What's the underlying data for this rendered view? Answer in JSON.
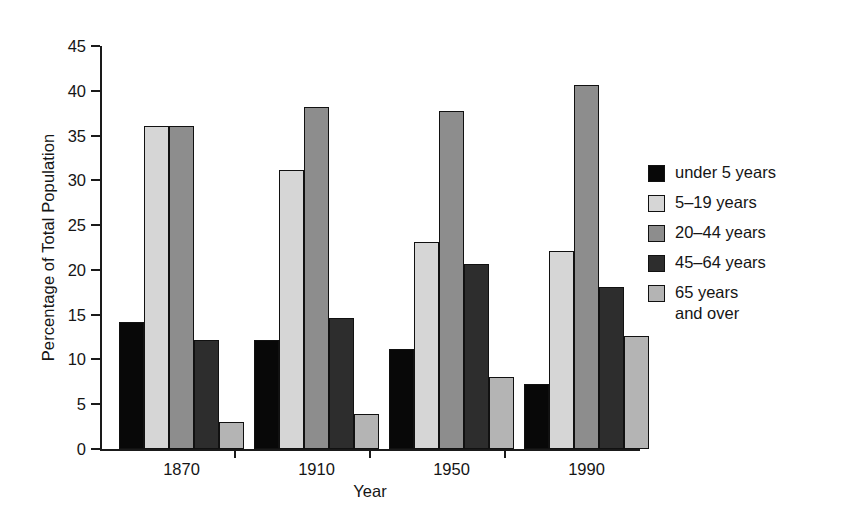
{
  "chart_data": {
    "type": "bar",
    "title": "",
    "subtitle": "",
    "xlabel": "Year",
    "ylabel": "Percentage of Total Population",
    "categories": [
      "1870",
      "1910",
      "1950",
      "1990"
    ],
    "series": [
      {
        "name": "under 5 years",
        "color": "#080808",
        "values": [
          14.2,
          12.2,
          11.2,
          7.3
        ]
      },
      {
        "name": "5–19 years",
        "color": "#d6d6d6",
        "values": [
          36.1,
          31.2,
          23.1,
          22.1
        ]
      },
      {
        "name": "20–44 years",
        "color": "#8d8d8d",
        "values": [
          36.1,
          38.2,
          37.7,
          40.7
        ]
      },
      {
        "name": "45–64 years",
        "color": "#2d2d2d",
        "values": [
          12.2,
          14.6,
          20.7,
          18.1
        ]
      },
      {
        "name": "65 years\nand over",
        "color": "#b4b4b4",
        "values": [
          3.0,
          3.9,
          8.0,
          12.6
        ]
      }
    ],
    "ylim": [
      0,
      45
    ],
    "ytick_step": 5,
    "yticks": [
      0,
      5,
      10,
      15,
      20,
      25,
      30,
      35,
      40,
      45
    ],
    "ytick_labels": [
      "0",
      "5",
      "10",
      "15",
      "20",
      "25",
      "30",
      "35",
      "40",
      "45"
    ],
    "grid": false,
    "legend_position": "right",
    "legend_entries": [
      "under 5 years",
      "5–19 years",
      "20–44 years",
      "45–64 years",
      "65 years\nand over"
    ]
  }
}
